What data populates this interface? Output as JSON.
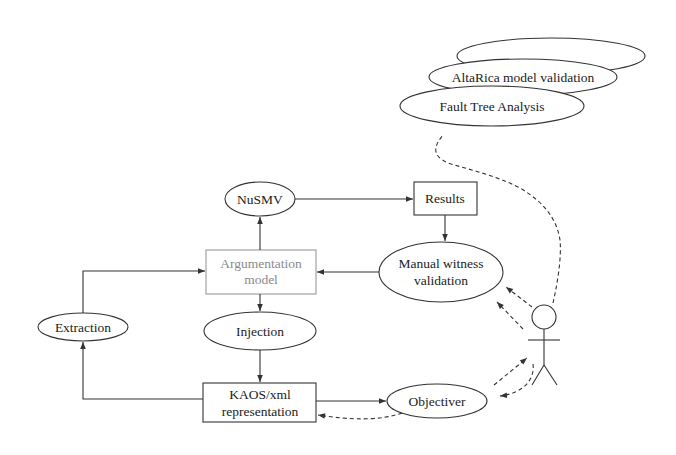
{
  "diagram": {
    "title": "",
    "colors": {
      "stroke": "#333333",
      "gray_box": "#9a9a9a",
      "gray_text": "#8a8a8a",
      "background": "#ffffff"
    },
    "nodes": {
      "stack_back": {
        "label": "",
        "shape": "ellipse"
      },
      "altarica": {
        "label": "AltaRica model validation",
        "shape": "ellipse"
      },
      "fault_tree": {
        "label": "Fault Tree Analysis",
        "shape": "ellipse"
      },
      "nusmv": {
        "label": "NuSMV",
        "shape": "ellipse"
      },
      "results": {
        "label": "Results",
        "shape": "box"
      },
      "argumentation": {
        "line1": "Argumentation",
        "line2": "model",
        "shape": "box",
        "style": "gray"
      },
      "manual_witness": {
        "line1": "Manual witness",
        "line2": "validation",
        "shape": "ellipse"
      },
      "extraction": {
        "label": "Extraction",
        "shape": "ellipse"
      },
      "injection": {
        "label": "Injection",
        "shape": "ellipse"
      },
      "kaos": {
        "line1": "KAOS/xml",
        "line2": "representation",
        "shape": "box"
      },
      "objectiver": {
        "label": "Objectiver",
        "shape": "ellipse"
      },
      "actor": {
        "label": "",
        "shape": "stick-figure"
      }
    },
    "edges": [
      {
        "from": "argumentation",
        "to": "nusmv",
        "style": "solid"
      },
      {
        "from": "nusmv",
        "to": "results",
        "style": "solid"
      },
      {
        "from": "results",
        "to": "manual_witness",
        "style": "solid"
      },
      {
        "from": "manual_witness",
        "to": "argumentation",
        "style": "solid"
      },
      {
        "from": "argumentation",
        "to": "injection",
        "style": "solid"
      },
      {
        "from": "injection",
        "to": "kaos",
        "style": "solid"
      },
      {
        "from": "kaos",
        "to": "extraction",
        "style": "solid"
      },
      {
        "from": "extraction",
        "to": "argumentation",
        "style": "solid"
      },
      {
        "from": "kaos",
        "to": "objectiver",
        "style": "solid"
      },
      {
        "from": "objectiver",
        "to": "kaos",
        "style": "dashed"
      },
      {
        "from": "actor",
        "to": "manual_witness",
        "style": "dashed"
      },
      {
        "from": "actor",
        "to": "manual_witness",
        "style": "dashed"
      },
      {
        "from": "objectiver",
        "to": "actor",
        "style": "dashed"
      },
      {
        "from": "actor",
        "to": "objectiver",
        "style": "dashed"
      },
      {
        "from": "actor",
        "to": "fault_tree",
        "style": "dashed"
      }
    ]
  }
}
